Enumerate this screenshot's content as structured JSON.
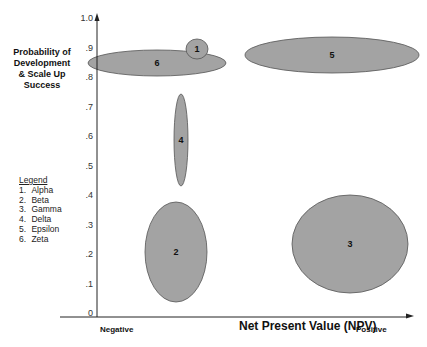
{
  "chart_data": {
    "type": "scatter",
    "subtype": "bubble-ellipse",
    "title": "",
    "xlabel": "Net Present Value (NPV)",
    "ylabel": "Probability of Development & Scale Up Success",
    "x_ends": {
      "left": "Negative",
      "right": "Positive"
    },
    "ylim": [
      0,
      1.0
    ],
    "y_ticks": [
      "0",
      ".1",
      ".2",
      ".3",
      ".4",
      ".5",
      ".6",
      ".7",
      ".8",
      ".9",
      "1.0"
    ],
    "grid": false,
    "legend": {
      "title": "Legend",
      "position": "left",
      "entries": [
        {
          "num": "1.",
          "name": "Alpha"
        },
        {
          "num": "2.",
          "name": "Beta"
        },
        {
          "num": "3.",
          "name": "Gamma"
        },
        {
          "num": "4.",
          "name": "Delta"
        },
        {
          "num": "5.",
          "name": "Epsilon"
        },
        {
          "num": "6.",
          "name": "Zeta"
        }
      ]
    },
    "items": [
      {
        "id": "1",
        "name": "Alpha",
        "x_rel": 0.32,
        "y_center": 0.89,
        "y_range": [
          0.86,
          0.93
        ],
        "cx": 197,
        "cy": 49,
        "rx": 11,
        "ry": 10
      },
      {
        "id": "2",
        "name": "Beta",
        "x_rel": 0.25,
        "y_center": 0.2,
        "y_range": [
          0.03,
          0.37
        ],
        "cx": 176,
        "cy": 252,
        "rx": 31,
        "ry": 50
      },
      {
        "id": "3",
        "name": "Gamma",
        "x_rel": 0.8,
        "y_center": 0.23,
        "y_range": [
          0.07,
          0.4
        ],
        "cx": 350,
        "cy": 244,
        "rx": 58,
        "ry": 49
      },
      {
        "id": "4",
        "name": "Delta",
        "x_rel": 0.27,
        "y_center": 0.58,
        "y_range": [
          0.43,
          0.73
        ],
        "cx": 181,
        "cy": 140,
        "rx": 7,
        "ry": 46
      },
      {
        "id": "5",
        "name": "Epsilon",
        "x_rel": 0.74,
        "y_center": 0.87,
        "y_range": [
          0.81,
          0.93
        ],
        "cx": 332,
        "cy": 55,
        "rx": 87,
        "ry": 18
      },
      {
        "id": "6",
        "name": "Zeta",
        "x_rel": 0.19,
        "y_center": 0.84,
        "y_range": [
          0.8,
          0.88
        ],
        "cx": 157,
        "cy": 63,
        "rx": 69,
        "ry": 13
      }
    ]
  },
  "colors": {
    "fill": "#a3a3a3",
    "stroke": "#555555",
    "axis": "#222222"
  },
  "labels": {
    "ylabel_lines": [
      "Probability of",
      "Development",
      "& Scale Up",
      "Success"
    ],
    "xlabel": "Net Present Value (NPV)",
    "negative": "Negative",
    "positive": "Positive",
    "legend_title": "Legend"
  }
}
